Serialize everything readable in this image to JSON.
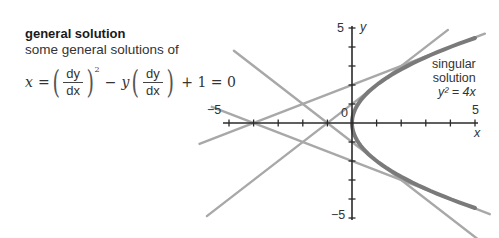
{
  "heading": {
    "title": "general solution",
    "subtitle": "some general solutions of"
  },
  "equation": {
    "lhs": "x",
    "eq": "=",
    "frac_num": "dy",
    "frac_den": "dx",
    "exponent": "2",
    "minus": "−",
    "y": "y",
    "plus_one": "+ 1 = 0"
  },
  "annotation": {
    "line1": "singular",
    "line2": "solution",
    "line3": "y² = 4x"
  },
  "axes": {
    "x_label": "x",
    "y_label": "y",
    "x_min_label": "−5",
    "x_max_label": "5",
    "y_max_label": "5",
    "y_min_label": "−5",
    "origin_label": "0"
  },
  "colors": {
    "axis": "#2a2a2a",
    "tangent_lines": "#a8a8a8",
    "parabola": "#7a7a7a"
  },
  "chart_data": {
    "type": "line",
    "title": "general solution",
    "subtitle": "some general solutions of x = (dy/dx)^2 − y(dy/dx) + 1 = 0",
    "xlabel": "x",
    "ylabel": "y",
    "xlim": [
      -5,
      5
    ],
    "ylim": [
      -5,
      5
    ],
    "x_ticks": [
      -5,
      -4,
      -3,
      -2,
      -1,
      0,
      1,
      2,
      3,
      4,
      5
    ],
    "y_ticks": [
      -5,
      -4,
      -3,
      -2,
      -1,
      0,
      1,
      2,
      3,
      4,
      5
    ],
    "grid": false,
    "series": [
      {
        "name": "general solution y = 0.5x + 2",
        "kind": "line",
        "slope": 0.5,
        "intercept": 2,
        "x": [
          -6.2,
          5.4
        ]
      },
      {
        "name": "general solution y = x + 1",
        "kind": "line",
        "slope": 1,
        "intercept": 1,
        "x": [
          -5.9,
          3.9
        ]
      },
      {
        "name": "general solution y = −x − 1",
        "kind": "line",
        "slope": -1,
        "intercept": -1,
        "x": [
          -4.8,
          5.3
        ]
      },
      {
        "name": "general solution y = −0.5x − 2",
        "kind": "line",
        "slope": -0.5,
        "intercept": -2,
        "x": [
          -5.7,
          5.6
        ]
      },
      {
        "name": "singular solution y² = 4x",
        "kind": "parabola",
        "equation": "y^2 = 4x",
        "x": [
          0,
          5
        ]
      }
    ],
    "annotations": [
      "singular solution y² = 4x"
    ]
  }
}
